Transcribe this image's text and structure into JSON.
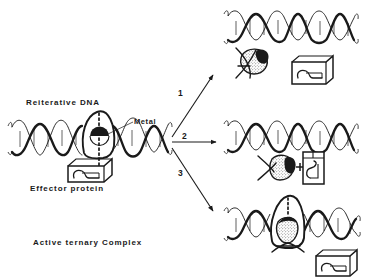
{
  "figure": {
    "background_color": "#ffffff",
    "ink_color": "#1a1a1a",
    "width": 375,
    "height": 279
  },
  "labels": {
    "reiterative_dna": "Reiterative DNA",
    "metal": "Metal",
    "effector_protein": "Effector protein",
    "active_ternary_complex": "Active ternary Complex"
  },
  "arrows": [
    {
      "number": "1",
      "direction": "up-right",
      "target": "panel-1"
    },
    {
      "number": "2",
      "direction": "right",
      "target": "panel-2"
    },
    {
      "number": "3",
      "direction": "down-right",
      "target": "panel-3"
    }
  ],
  "left_complex": {
    "dna": "reiterative-dna-double-helix",
    "bulge": "dna-bulge-loop",
    "metal_marker": "metal-half-disc",
    "dotted_axis": "metal-coordination-axis",
    "protein": "effector-protein-box"
  },
  "panels": [
    {
      "id": "panel-1",
      "number": "1",
      "dna": "relaxed-straight-double-helix",
      "components": [
        "denatured-metal-blob",
        "effector-protein-box"
      ]
    },
    {
      "id": "panel-2",
      "number": "2",
      "dna": "relaxed-straight-double-helix",
      "components": [
        "metal-blob-with-crossed-strands",
        "plus-sign",
        "effector-protein-box-upright"
      ]
    },
    {
      "id": "panel-3",
      "number": "3",
      "dna": "reiterative-dna-with-bulge",
      "components": [
        "metal-blob-in-bulge",
        "effector-protein-box"
      ]
    }
  ]
}
